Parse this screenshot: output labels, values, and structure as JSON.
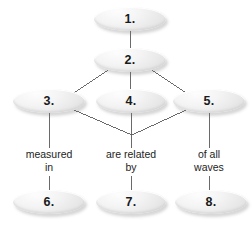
{
  "diagram": {
    "node_fill": "#f2f2f2",
    "line_color": "#5a5a5a",
    "text_color": "#1d1d1d",
    "background": "#ffffff",
    "nodes": [
      {
        "id": "node-1",
        "label": "1.",
        "cx": 130,
        "cy": 19,
        "rx": 36,
        "ry": 12
      },
      {
        "id": "node-2",
        "label": "2.",
        "cx": 130,
        "cy": 60,
        "rx": 36,
        "ry": 12
      },
      {
        "id": "node-3",
        "label": "3.",
        "cx": 49,
        "cy": 101,
        "rx": 36,
        "ry": 12
      },
      {
        "id": "node-4",
        "label": "4.",
        "cx": 131,
        "cy": 101,
        "rx": 35,
        "ry": 12
      },
      {
        "id": "node-5",
        "label": "5.",
        "cx": 209,
        "cy": 101,
        "rx": 36,
        "ry": 12
      },
      {
        "id": "node-6",
        "label": "6.",
        "cx": 49,
        "cy": 202,
        "rx": 36,
        "ry": 12
      },
      {
        "id": "node-7",
        "label": "7.",
        "cx": 131,
        "cy": 202,
        "rx": 35,
        "ry": 12
      },
      {
        "id": "node-8",
        "label": "8.",
        "cx": 211,
        "cy": 202,
        "rx": 36,
        "ry": 12
      }
    ],
    "link_labels": [
      {
        "id": "link-label-left",
        "text": "measured\nin",
        "cx": 49,
        "cy": 162
      },
      {
        "id": "link-label-center",
        "text": "are related\nby",
        "cx": 131,
        "cy": 162
      },
      {
        "id": "link-label-right",
        "text": "of all\nwaves",
        "cx": 209,
        "cy": 162
      }
    ],
    "edges": [
      {
        "id": "edge-1-2",
        "x1": 130,
        "y1": 31,
        "x2": 130,
        "y2": 48
      },
      {
        "id": "edge-2-3",
        "x1": 108,
        "y1": 70,
        "x2": 74,
        "y2": 93
      },
      {
        "id": "edge-2-4",
        "x1": 130,
        "y1": 72,
        "x2": 130,
        "y2": 89
      },
      {
        "id": "edge-2-5",
        "x1": 152,
        "y1": 70,
        "x2": 186,
        "y2": 93
      },
      {
        "id": "edge-3-join",
        "x1": 74,
        "y1": 110,
        "x2": 132,
        "y2": 135
      },
      {
        "id": "edge-5-join",
        "x1": 186,
        "y1": 110,
        "x2": 132,
        "y2": 135
      },
      {
        "id": "edge-3-label",
        "x1": 49,
        "y1": 113,
        "x2": 49,
        "y2": 148
      },
      {
        "id": "edge-4-label",
        "x1": 131,
        "y1": 113,
        "x2": 131,
        "y2": 148
      },
      {
        "id": "edge-5-label",
        "x1": 209,
        "y1": 113,
        "x2": 209,
        "y2": 148
      },
      {
        "id": "edge-label-6",
        "x1": 49,
        "y1": 176,
        "x2": 49,
        "y2": 191
      },
      {
        "id": "edge-label-7",
        "x1": 131,
        "y1": 176,
        "x2": 131,
        "y2": 191
      },
      {
        "id": "edge-label-8",
        "x1": 209,
        "y1": 176,
        "x2": 209,
        "y2": 191
      }
    ]
  }
}
